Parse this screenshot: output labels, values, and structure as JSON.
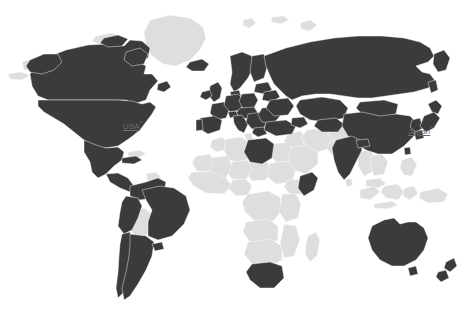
{
  "map": {
    "title": "World map",
    "projection": "equirectangular-world",
    "background_color": "#ffffff",
    "highlight_color": "#3b3b3b",
    "base_color": "#dedede",
    "border_color": "#ffffff",
    "label_color": "#6f6f6f",
    "width": 470,
    "height": 316,
    "labels": [
      {
        "id": "usa",
        "text": "USA",
        "footnote_marker": "*",
        "x": 123,
        "y": 119,
        "style": "link-underlined"
      },
      {
        "id": "japan",
        "text": "Japan",
        "footnote_marker": "*",
        "x": 408,
        "y": 124,
        "style": "link-underlined"
      }
    ],
    "legend": {
      "highlighted_meaning": "selected",
      "base_meaning": "not selected"
    },
    "highlighted_regions": [
      "Canada",
      "United States of America",
      "Mexico",
      "Guatemala",
      "Honduras",
      "Nicaragua",
      "Costa Rica",
      "Panama",
      "Cuba",
      "Colombia",
      "Venezuela",
      "Ecuador",
      "Peru",
      "Brazil",
      "Chile",
      "Argentina",
      "Uruguay",
      "Iceland",
      "Ireland",
      "United Kingdom",
      "Norway",
      "Sweden",
      "Finland",
      "Denmark",
      "Netherlands",
      "Belgium",
      "Germany",
      "Poland",
      "Czechia",
      "Austria",
      "Switzerland",
      "France",
      "Spain",
      "Portugal",
      "Italy",
      "Greece",
      "Romania",
      "Bulgaria",
      "Hungary",
      "Ukraine",
      "Belarus",
      "Baltic States",
      "Russia",
      "Turkey",
      "Kazakhstan",
      "China",
      "Mongolia",
      "Japan",
      "South Korea",
      "India",
      "Libya",
      "Somalia",
      "South Africa",
      "Australia",
      "New Zealand"
    ],
    "base_regions": [
      "Greenland",
      "Bolivia",
      "Paraguay",
      "Guyana",
      "Suriname",
      "Morocco",
      "Algeria",
      "Tunisia",
      "Egypt",
      "Sudan",
      "Chad",
      "Niger",
      "Mali",
      "Mauritania",
      "Nigeria",
      "Ethiopia",
      "Kenya",
      "Tanzania",
      "Angola",
      "Namibia",
      "Botswana",
      "Zimbabwe",
      "Mozambique",
      "Madagascar",
      "Democratic Republic of the Congo",
      "Saudi Arabia",
      "Iran",
      "Iraq",
      "Pakistan",
      "Afghanistan",
      "Myanmar",
      "Thailand",
      "Vietnam",
      "Malaysia",
      "Indonesia",
      "Philippines",
      "Papua New Guinea"
    ]
  }
}
